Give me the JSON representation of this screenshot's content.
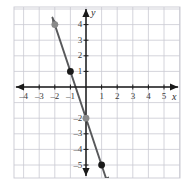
{
  "figure": {
    "name": "coordinate-plane-line-graph",
    "background": "#ffffff",
    "width": 195,
    "height": 196
  },
  "axes": {
    "x_axis_label": "x",
    "y_axis_label": "y",
    "axis_color": "#1a1a1a",
    "grid_color": "#c8c8d0",
    "x_ticks": [
      {
        "value": -4,
        "label": "–4"
      },
      {
        "value": -3,
        "label": "–3"
      },
      {
        "value": -2,
        "label": "–2"
      },
      {
        "value": -1,
        "label": "–1"
      },
      {
        "value": 1,
        "label": "1"
      },
      {
        "value": 2,
        "label": "2"
      },
      {
        "value": 3,
        "label": "3"
      },
      {
        "value": 4,
        "label": "4"
      },
      {
        "value": 5,
        "label": "5"
      }
    ],
    "y_ticks": [
      {
        "value": 4,
        "label": "4"
      },
      {
        "value": 3,
        "label": "3"
      },
      {
        "value": 2,
        "label": "2"
      },
      {
        "value": 1,
        "label": "1"
      },
      {
        "value": -2,
        "label": "–2"
      },
      {
        "value": -3,
        "label": "–3"
      },
      {
        "value": -4,
        "label": "–4"
      },
      {
        "value": -5,
        "label": "–5"
      }
    ]
  },
  "chart_data": {
    "type": "line",
    "title": "",
    "xlabel": "x",
    "ylabel": "y",
    "xlim": [
      -5.5,
      6
    ],
    "ylim": [
      -6.5,
      5.5
    ],
    "grid": true,
    "legend": "none",
    "series": [
      {
        "name": "line",
        "equation": "y = -3x - 2",
        "slope": -3,
        "intercept": -2,
        "color": "#58595b",
        "x": [
          -2.15,
          1.45
        ],
        "y": [
          4.45,
          -6.35
        ],
        "arrows": "both"
      }
    ],
    "points": [
      {
        "x": -2,
        "y": 4,
        "label": "",
        "color": "#8a8a8a",
        "style": "filled-circle"
      },
      {
        "x": -1,
        "y": 1,
        "label": "",
        "color": "#1a1a1a",
        "style": "filled-circle"
      },
      {
        "x": 0,
        "y": -2,
        "label": "",
        "color": "#8a8a8a",
        "style": "filled-circle"
      },
      {
        "x": 1,
        "y": -5,
        "label": "",
        "color": "#1a1a1a",
        "style": "filled-circle"
      }
    ]
  }
}
